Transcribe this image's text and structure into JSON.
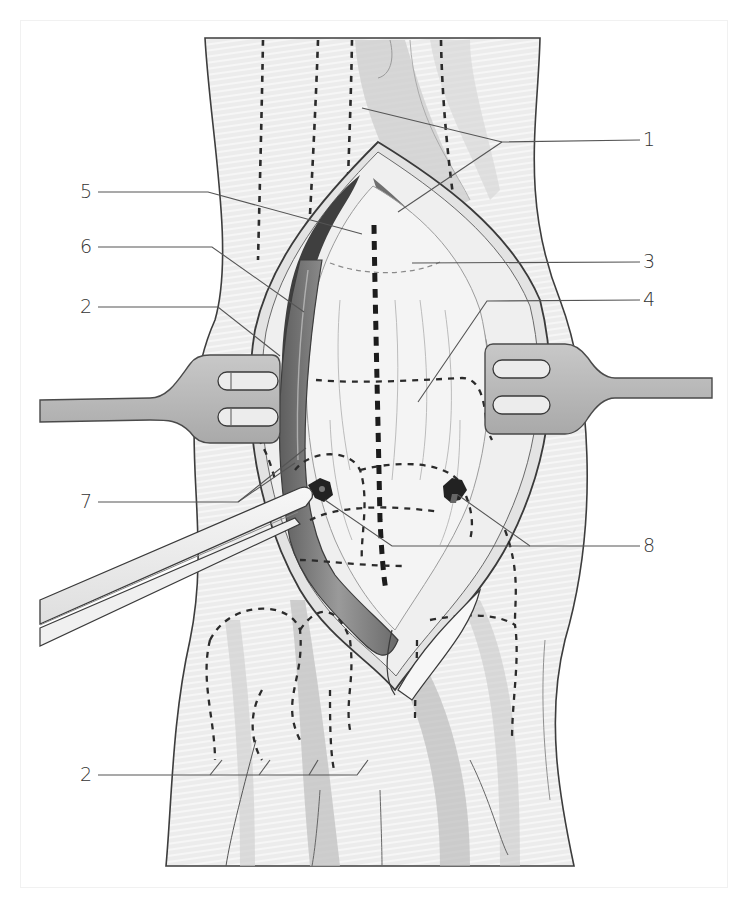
{
  "figure": {
    "type": "surgical-illustration",
    "colors": {
      "background": "#ffffff",
      "skin": "#e9e9e9",
      "skin_stripe": "#f4f4f4",
      "tissue_dark": "#7a7a7a",
      "tissue_mid": "#b4b4b4",
      "capsule_light": "#f5f5f5",
      "retractor": "#b8b8b8",
      "outline": "#444444",
      "leader": "#555555",
      "label_text": "#333333"
    }
  },
  "labels": [
    {
      "id": "label-1",
      "text": "1",
      "x": 648,
      "y": 132
    },
    {
      "id": "label-5",
      "text": "5",
      "x": 80,
      "y": 183
    },
    {
      "id": "label-6",
      "text": "6",
      "x": 80,
      "y": 238
    },
    {
      "id": "label-3",
      "text": "3",
      "x": 648,
      "y": 252
    },
    {
      "id": "label-2a",
      "text": "2",
      "x": 80,
      "y": 298
    },
    {
      "id": "label-4",
      "text": "4",
      "x": 648,
      "y": 290
    },
    {
      "id": "label-7",
      "text": "7",
      "x": 80,
      "y": 493
    },
    {
      "id": "label-8",
      "text": "8",
      "x": 648,
      "y": 537
    },
    {
      "id": "label-2b",
      "text": "2",
      "x": 80,
      "y": 769
    }
  ]
}
